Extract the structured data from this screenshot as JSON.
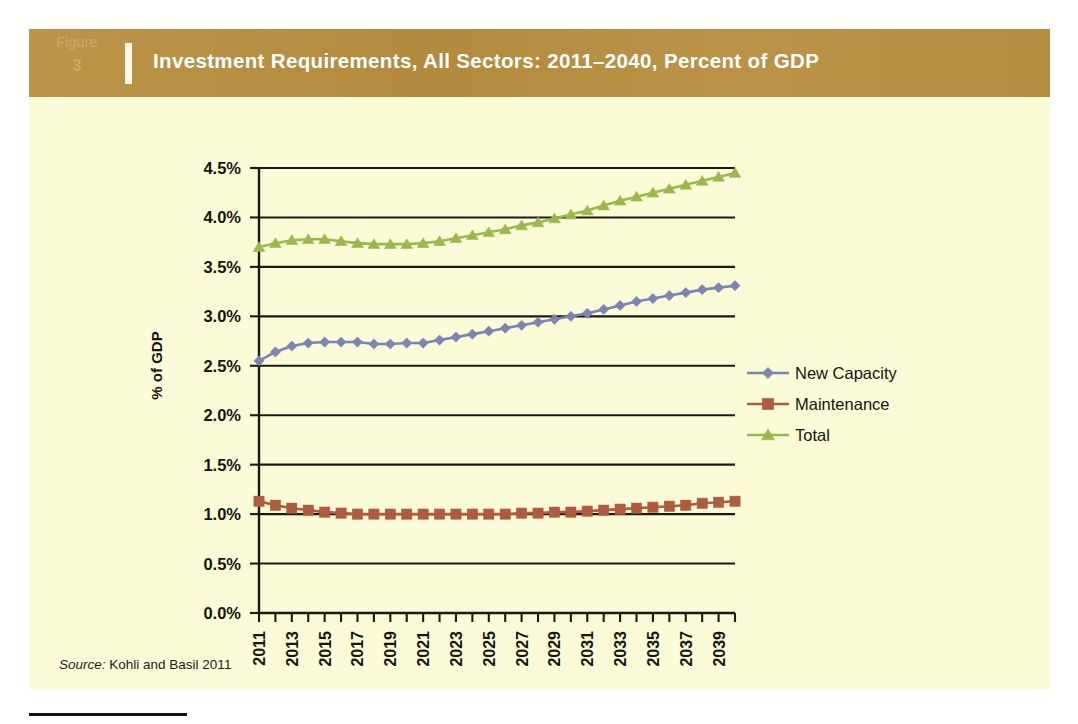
{
  "figure": {
    "tag_word": "Figure",
    "tag_number": "3",
    "title": "Investment Requirements, All Sectors: 2011–2040, Percent of GDP",
    "source_label": "Source:",
    "source_text": "Kohli and Basil 2011"
  },
  "colors": {
    "panel_background": "#fbfbd7",
    "header_band": "#b88f3f",
    "header_tag_text": "#cbaa6d",
    "header_title_text": "#ffffff",
    "axis": "#1a1a14",
    "gridline": "#1a1a14",
    "new_capacity": "#7a85b4",
    "maintenance": "#ae5c3c",
    "total": "#9cb84a"
  },
  "chart_data": {
    "type": "line",
    "title": "Investment Requirements, All Sectors: 2011–2040, Percent of GDP",
    "xlabel": "",
    "ylabel": "% of GDP",
    "ylim": [
      0.0,
      4.5
    ],
    "ytick_values": [
      0.0,
      0.5,
      1.0,
      1.5,
      2.0,
      2.5,
      3.0,
      3.5,
      4.0,
      4.5
    ],
    "ytick_labels": [
      "0.0%",
      "0.5%",
      "1.0%",
      "1.5%",
      "2.0%",
      "2.5%",
      "3.0%",
      "3.5%",
      "4.0%",
      "4.5%"
    ],
    "grid": true,
    "grid_axis": "y",
    "legend_position": "right",
    "x": [
      2011,
      2012,
      2013,
      2014,
      2015,
      2016,
      2017,
      2018,
      2019,
      2020,
      2021,
      2022,
      2023,
      2024,
      2025,
      2026,
      2027,
      2028,
      2029,
      2030,
      2031,
      2032,
      2033,
      2034,
      2035,
      2036,
      2037,
      2038,
      2039,
      2040
    ],
    "xtick_labels": [
      "2011",
      "",
      "2013",
      "",
      "2015",
      "",
      "2017",
      "",
      "2019",
      "",
      "2021",
      "",
      "2023",
      "",
      "2025",
      "",
      "2027",
      "",
      "2029",
      "",
      "2031",
      "",
      "2033",
      "",
      "2035",
      "",
      "2037",
      "",
      "2039",
      ""
    ],
    "series": [
      {
        "name": "New Capacity",
        "color": "#7a85b4",
        "marker": "diamond",
        "values": [
          2.55,
          2.64,
          2.7,
          2.73,
          2.74,
          2.74,
          2.74,
          2.72,
          2.72,
          2.73,
          2.73,
          2.76,
          2.79,
          2.82,
          2.85,
          2.88,
          2.91,
          2.94,
          2.97,
          3.0,
          3.03,
          3.07,
          3.11,
          3.15,
          3.18,
          3.21,
          3.24,
          3.27,
          3.29,
          3.31
        ]
      },
      {
        "name": "Maintenance",
        "color": "#ae5c3c",
        "marker": "square",
        "values": [
          1.13,
          1.09,
          1.06,
          1.04,
          1.02,
          1.01,
          1.0,
          1.0,
          1.0,
          1.0,
          1.0,
          1.0,
          1.0,
          1.0,
          1.0,
          1.0,
          1.01,
          1.01,
          1.02,
          1.02,
          1.03,
          1.04,
          1.05,
          1.06,
          1.07,
          1.08,
          1.09,
          1.11,
          1.12,
          1.13
        ]
      },
      {
        "name": "Total",
        "color": "#9cb84a",
        "marker": "triangle",
        "values": [
          3.7,
          3.74,
          3.77,
          3.78,
          3.78,
          3.76,
          3.74,
          3.73,
          3.73,
          3.73,
          3.74,
          3.76,
          3.79,
          3.82,
          3.85,
          3.88,
          3.92,
          3.95,
          3.99,
          4.03,
          4.07,
          4.12,
          4.17,
          4.21,
          4.25,
          4.29,
          4.33,
          4.37,
          4.41,
          4.45
        ]
      }
    ]
  }
}
